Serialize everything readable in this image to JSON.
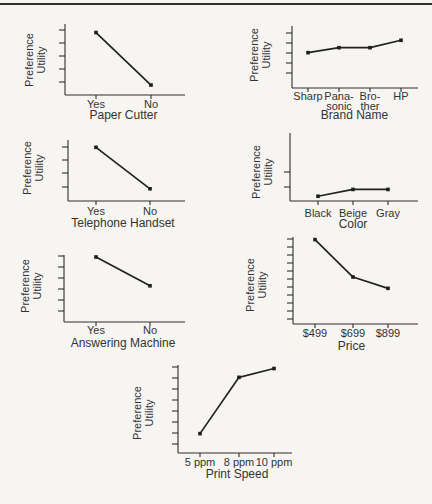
{
  "style": {
    "background": "#f6f5f2",
    "ink": "#2f2f2f",
    "line_color": "#222222",
    "marker": "square"
  },
  "chart_data": [
    {
      "id": "paper-cutter",
      "type": "line",
      "title": "",
      "xlabel": "Paper Cutter",
      "ylabel": "Preference Utility",
      "ylabel_lines": [
        "Preference",
        "Utility"
      ],
      "categories": [
        [
          "Yes"
        ],
        [
          "No"
        ]
      ],
      "values": [
        0.88,
        0.14
      ],
      "ylim": [
        0,
        1
      ],
      "y_tick_count": 5,
      "y_numeric_labels_shown": false,
      "grid": false,
      "note": "values estimated as fraction of unlabeled y-axis height"
    },
    {
      "id": "brand-name",
      "type": "line",
      "title": "",
      "xlabel": "Brand Name",
      "ylabel": "Preference Utility",
      "ylabel_lines": [
        "Preference",
        "Utility"
      ],
      "categories": [
        [
          "Sharp"
        ],
        [
          "Pana-",
          "sonic"
        ],
        [
          "Bro-",
          "ther"
        ],
        [
          "HP"
        ]
      ],
      "values": [
        0.57,
        0.65,
        0.65,
        0.77
      ],
      "ylim": [
        0,
        1
      ],
      "y_tick_count": 5,
      "y_numeric_labels_shown": false,
      "grid": false,
      "note": "values estimated as fraction of unlabeled y-axis height"
    },
    {
      "id": "telephone-handset",
      "type": "line",
      "title": "",
      "xlabel": "Telephone Handset",
      "ylabel": "Preference Utility",
      "ylabel_lines": [
        "Preference",
        "Utility"
      ],
      "categories": [
        [
          "Yes"
        ],
        [
          "No"
        ]
      ],
      "values": [
        0.88,
        0.2
      ],
      "ylim": [
        0,
        1
      ],
      "y_tick_count": 4,
      "y_numeric_labels_shown": false,
      "grid": false,
      "note": "values estimated as fraction of unlabeled y-axis height"
    },
    {
      "id": "color",
      "type": "line",
      "title": "",
      "xlabel": "Color",
      "ylabel": "Preference Utility",
      "ylabel_lines": [
        "Preference",
        "Utility"
      ],
      "categories": [
        [
          "Black"
        ],
        [
          "Beige"
        ],
        [
          "Gray"
        ]
      ],
      "values": [
        0.07,
        0.17,
        0.17
      ],
      "ylim": [
        0,
        1
      ],
      "y_tick_count": 2,
      "y_numeric_labels_shown": false,
      "grid": false,
      "note": "values estimated as fraction of unlabeled y-axis height"
    },
    {
      "id": "answering-machine",
      "type": "line",
      "title": "",
      "xlabel": "Answering Machine",
      "ylabel": "Preference Utility",
      "ylabel_lines": [
        "Preference",
        "Utility"
      ],
      "categories": [
        [
          "Yes"
        ],
        [
          "No"
        ]
      ],
      "values": [
        0.97,
        0.54
      ],
      "ylim": [
        0,
        1
      ],
      "y_tick_count": 6,
      "y_numeric_labels_shown": false,
      "grid": false,
      "note": "values estimated as fraction of unlabeled y-axis height"
    },
    {
      "id": "price",
      "type": "line",
      "title": "",
      "xlabel": "Price",
      "ylabel": "Preference Utility",
      "ylabel_lines": [
        "Preference",
        "Utility"
      ],
      "categories": [
        [
          "$499"
        ],
        [
          "$699"
        ],
        [
          "$899"
        ]
      ],
      "values": [
        0.97,
        0.54,
        0.41
      ],
      "ylim": [
        0,
        1
      ],
      "y_tick_count": 11,
      "y_numeric_labels_shown": false,
      "grid": false,
      "note": "values estimated as fraction of unlabeled y-axis height"
    },
    {
      "id": "print-speed",
      "type": "line",
      "title": "",
      "xlabel": "Print Speed",
      "ylabel": "Preference Utility",
      "ylabel_lines": [
        "Preference",
        "Utility"
      ],
      "categories": [
        [
          "5 ppm"
        ],
        [
          "8 ppm"
        ],
        [
          "10 ppm"
        ]
      ],
      "values": [
        0.22,
        0.86,
        0.96
      ],
      "ylim": [
        0,
        1
      ],
      "y_tick_count": 8,
      "y_numeric_labels_shown": false,
      "grid": false,
      "note": "values estimated as fraction of unlabeled y-axis height"
    }
  ]
}
